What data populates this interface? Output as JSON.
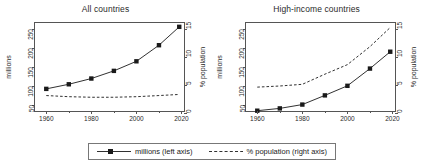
{
  "figure": {
    "background": "#ffffff",
    "line_color": "#1a1a1a",
    "frame_color": "#555555"
  },
  "legend": {
    "entries": [
      {
        "label": "millions (left axis)",
        "style": "solid-with-square-marker",
        "icon": "solid-line-marker-icon"
      },
      {
        "label": "% population (right axis)",
        "style": "dashed",
        "icon": "dashed-line-icon"
      }
    ]
  },
  "panels": [
    {
      "title": "All countries",
      "y_left_label": "millions",
      "y_right_label": "% population",
      "x_ticks_major": [
        "1960",
        "1980",
        "2000",
        "2020"
      ],
      "x_ticks_minor": [
        "1970",
        "1990",
        "2010"
      ],
      "y_left_ticks": [
        "50",
        "100",
        "150",
        "200",
        "250"
      ],
      "y_right_ticks": [
        "0",
        "5",
        "10",
        "15"
      ]
    },
    {
      "title": "High-income countries",
      "y_left_label": "millions",
      "y_right_label": "% population",
      "x_ticks_major": [
        "1960",
        "1980",
        "2000",
        "2020"
      ],
      "x_ticks_minor": [
        "1970",
        "1990",
        "2010"
      ],
      "y_left_ticks": [
        "50",
        "100",
        "150",
        "200",
        "250"
      ],
      "y_right_ticks": [
        "0",
        "5",
        "10",
        "15"
      ]
    }
  ],
  "chart_data": [
    {
      "type": "line",
      "title": "All countries",
      "xlabel": "",
      "ylabel": "millions",
      "y2label": "% population",
      "xlim": [
        1955,
        2022
      ],
      "ylim": [
        30,
        265
      ],
      "y2lim": [
        0,
        16
      ],
      "grid": false,
      "legend_position": "bottom-outside",
      "x": [
        1960,
        1970,
        1980,
        1990,
        2000,
        2010,
        2019
      ],
      "series": [
        {
          "name": "millions (left axis)",
          "axis": "left",
          "style": "solid",
          "marker": "square",
          "values": [
            93,
            105,
            120,
            140,
            165,
            207,
            255
          ]
        },
        {
          "name": "% population (right axis)",
          "axis": "right",
          "style": "dashed",
          "marker": "none",
          "values": [
            3.1,
            2.9,
            2.8,
            2.8,
            2.9,
            3.1,
            3.3
          ]
        }
      ]
    },
    {
      "type": "line",
      "title": "High-income countries",
      "xlabel": "",
      "ylabel": "millions",
      "y2label": "% population",
      "xlim": [
        1955,
        2022
      ],
      "ylim": [
        30,
        265
      ],
      "y2lim": [
        0,
        16
      ],
      "grid": false,
      "legend_position": "bottom-outside",
      "x": [
        1960,
        1970,
        1980,
        1990,
        2000,
        2010,
        2019
      ],
      "series": [
        {
          "name": "millions (left axis)",
          "axis": "left",
          "style": "solid",
          "marker": "square",
          "values": [
            36,
            42,
            52,
            76,
            101,
            146,
            190
          ]
        },
        {
          "name": "% population (right axis)",
          "axis": "right",
          "style": "dashed",
          "marker": "none",
          "values": [
            4.6,
            4.8,
            5.1,
            6.9,
            8.6,
            11.8,
            15.2
          ]
        }
      ]
    }
  ]
}
